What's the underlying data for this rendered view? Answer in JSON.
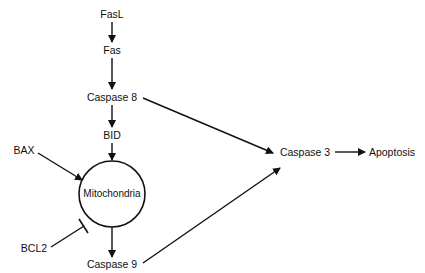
{
  "diagram": {
    "type": "signaling-pathway",
    "nodes": {
      "fasl": {
        "label": "FasL"
      },
      "fas": {
        "label": "Fas"
      },
      "caspase8": {
        "label": "Caspase 8"
      },
      "bid": {
        "label": "BID"
      },
      "bax": {
        "label": "BAX"
      },
      "mitochondria": {
        "label": "Mitochondria"
      },
      "bcl2": {
        "label": "BCL2"
      },
      "caspase9": {
        "label": "Caspase 9"
      },
      "caspase3": {
        "label": "Caspase 3"
      },
      "apoptosis": {
        "label": "Apoptosis"
      }
    },
    "edges": [
      {
        "from": "FasL",
        "to": "Fas",
        "type": "activates"
      },
      {
        "from": "Fas",
        "to": "Caspase 8",
        "type": "activates"
      },
      {
        "from": "Caspase 8",
        "to": "BID",
        "type": "activates"
      },
      {
        "from": "Caspase 8",
        "to": "Caspase 3",
        "type": "activates"
      },
      {
        "from": "BID",
        "to": "Mitochondria",
        "type": "activates"
      },
      {
        "from": "BAX",
        "to": "Mitochondria",
        "type": "activates"
      },
      {
        "from": "BCL2",
        "to": "Mitochondria",
        "type": "inhibits"
      },
      {
        "from": "Mitochondria",
        "to": "Caspase 9",
        "type": "activates"
      },
      {
        "from": "Caspase 9",
        "to": "Caspase 3",
        "type": "activates"
      },
      {
        "from": "Caspase 3",
        "to": "Apoptosis",
        "type": "activates"
      }
    ]
  }
}
